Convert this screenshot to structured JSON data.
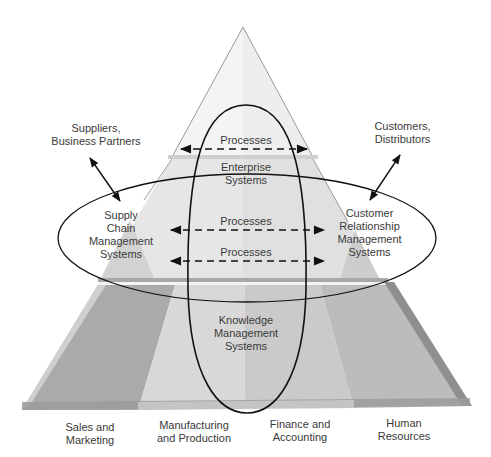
{
  "diagram": {
    "type": "pyramid",
    "colors": {
      "background": "#ffffff",
      "pyramid_top": "#ececec",
      "pyramid_mid": "#dcdcdc",
      "base_sales": "#a9a9a9",
      "base_manufacturing": "#d6d6d6",
      "base_finance": "#c9c9c9",
      "base_hr": "#b8b8b8",
      "outline": "#222222",
      "text": "#3a3a3a"
    },
    "external": {
      "suppliers": "Suppliers,\nBusiness Partners",
      "customers": "Customers,\nDistributors"
    },
    "systems": {
      "enterprise": "Enterprise\nSystems",
      "supply_chain": "Supply\nChain\nManagement\nSystems",
      "crm": "Customer\nRelationship\nManagement\nSystems",
      "knowledge": "Knowledge\nManagement\nSystems"
    },
    "processes": [
      {
        "label": "Processes"
      },
      {
        "label": "Processes"
      },
      {
        "label": "Processes"
      }
    ],
    "functional_areas": [
      {
        "label": "Sales and\nMarketing"
      },
      {
        "label": "Manufacturing\nand Production"
      },
      {
        "label": "Finance and\nAccounting"
      },
      {
        "label": "Human\nResources"
      }
    ]
  }
}
